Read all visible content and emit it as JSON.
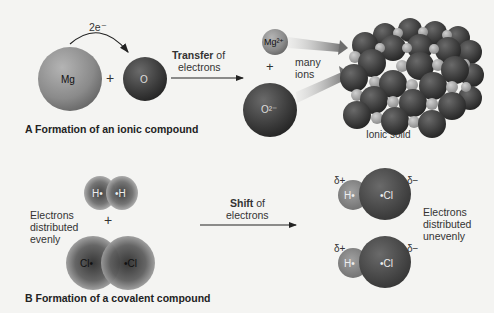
{
  "section_a": {
    "caption": "A  Formation of an ionic compound",
    "electron_label": "2e⁻",
    "mg_atom": "Mg",
    "o_atom": "O",
    "plus": "+",
    "transfer_bold": "Transfer",
    "transfer_rest": " of",
    "transfer_line2": "electrons",
    "mg_ion": "Mg²⁺",
    "o_ion": "O²⁻",
    "ion_plus": "+",
    "many_ions_1": "many",
    "many_ions_2": "ions",
    "solid_label": "Ionic solid"
  },
  "section_b": {
    "caption": "B  Formation of a covalent compound",
    "even_1": "Electrons",
    "even_2": "distributed",
    "even_3": "evenly",
    "h2_left": "H•",
    "h2_right": "•H",
    "cl2_left": "Cl•",
    "cl2_right": "•Cl",
    "plus": "+",
    "shift_bold": "Shift",
    "shift_rest": " of",
    "shift_line2": "electrons",
    "hcl_h": "H•",
    "hcl_cl": "•Cl",
    "delta_plus": "δ+",
    "delta_minus": "δ−",
    "uneven_1": "Electrons",
    "uneven_2": "distributed",
    "uneven_3": "unevenly"
  },
  "colors": {
    "background": "#f4f4f2",
    "mg_sphere": "#8e8e8e",
    "o_sphere": "#3c3c3c",
    "light_ion": "#a8a8a8"
  }
}
